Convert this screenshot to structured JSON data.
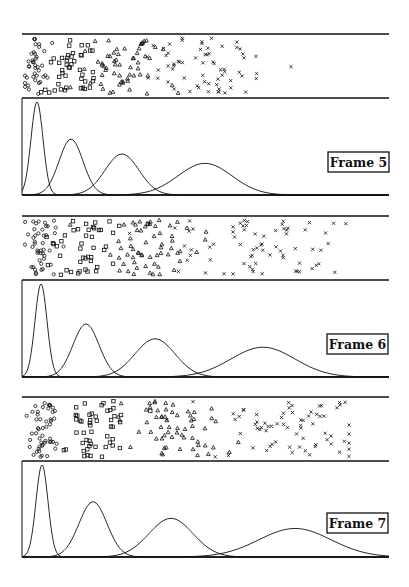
{
  "chart_data": [
    {
      "type": "scatter+line",
      "title": "Frame 5",
      "components": 4,
      "markers": [
        "circle",
        "square",
        "triangle",
        "cross"
      ],
      "scatter": {
        "description": "Jittered 1-D samples per component, shown as symbols",
        "counts": [
          40,
          45,
          60,
          65
        ]
      },
      "density_curves": [
        {
          "marker": "circle",
          "peak_x_px": 37,
          "sigma_px": 6,
          "height": 1.0
        },
        {
          "marker": "square",
          "peak_x_px": 71,
          "sigma_px": 12,
          "height": 0.6
        },
        {
          "marker": "triangle",
          "peak_x_px": 122,
          "sigma_px": 17,
          "height": 0.44
        },
        {
          "marker": "cross",
          "peak_x_px": 205,
          "sigma_px": 27,
          "height": 0.34
        }
      ],
      "grid": false,
      "legend": "none"
    },
    {
      "type": "scatter+line",
      "title": "Frame 6",
      "components": 4,
      "markers": [
        "circle",
        "square",
        "triangle",
        "cross"
      ],
      "scatter": {
        "counts": [
          45,
          45,
          60,
          70
        ]
      },
      "density_curves": [
        {
          "marker": "circle",
          "peak_x_px": 41,
          "sigma_px": 6,
          "height": 1.0
        },
        {
          "marker": "square",
          "peak_x_px": 86,
          "sigma_px": 13,
          "height": 0.57
        },
        {
          "marker": "triangle",
          "peak_x_px": 155,
          "sigma_px": 20,
          "height": 0.41
        },
        {
          "marker": "cross",
          "peak_x_px": 263,
          "sigma_px": 32,
          "height": 0.32
        }
      ],
      "grid": false,
      "legend": "none"
    },
    {
      "type": "scatter+line",
      "title": "Frame 7",
      "components": 4,
      "markers": [
        "circle",
        "square",
        "triangle",
        "cross"
      ],
      "scatter": {
        "counts": [
          50,
          50,
          60,
          70
        ]
      },
      "density_curves": [
        {
          "marker": "circle",
          "peak_x_px": 42,
          "sigma_px": 6,
          "height": 1.0
        },
        {
          "marker": "square",
          "peak_x_px": 93,
          "sigma_px": 14,
          "height": 0.6
        },
        {
          "marker": "triangle",
          "peak_x_px": 171,
          "sigma_px": 22,
          "height": 0.42
        },
        {
          "marker": "cross",
          "peak_x_px": 295,
          "sigma_px": 36,
          "height": 0.31
        }
      ],
      "grid": false,
      "legend": "none"
    }
  ],
  "panels": [
    {
      "label": "Frame 5",
      "top": 34,
      "mid": 98,
      "bottom": 195,
      "label_box": {
        "x": 328,
        "y": 152,
        "w": 61,
        "h": 20
      }
    },
    {
      "label": "Frame 6",
      "top": 216,
      "mid": 280,
      "bottom": 377,
      "label_box": {
        "x": 327,
        "y": 334,
        "w": 61,
        "h": 20
      }
    },
    {
      "label": "Frame 7",
      "top": 397,
      "mid": 461,
      "bottom": 557,
      "label_box": {
        "x": 327,
        "y": 513,
        "w": 61,
        "h": 20
      }
    }
  ],
  "axes": {
    "left": 22,
    "right": 389
  },
  "colors": {
    "ink": "#111111",
    "background": "#ffffff"
  }
}
